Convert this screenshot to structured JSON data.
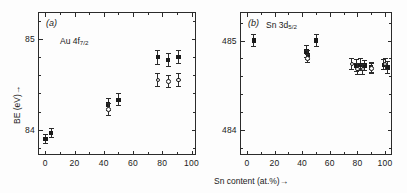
{
  "figure": {
    "xlabel": "Sn content (at.%)→",
    "ylabel": "BE (eV)→"
  },
  "chart_data": [
    {
      "type": "scatter",
      "panel": "(a)",
      "series_label_main": "Au 4f",
      "series_label_sub": "7/2",
      "title": "",
      "xlabel": "Sn content (at.%)→",
      "ylabel": "BE (eV)→",
      "xlim": [
        -5,
        103
      ],
      "ylim": [
        83.72,
        85.3
      ],
      "xticks": [
        0,
        20,
        40,
        60,
        80,
        100
      ],
      "xticklabels": [
        "0",
        "20",
        "40",
        "60",
        "80",
        "100"
      ],
      "yticks": [
        84,
        85
      ],
      "yticklabels": [
        "84",
        "85"
      ],
      "grid": false,
      "legend": "none",
      "series": [
        {
          "name": "filled-square",
          "marker": "filled-square",
          "points": [
            {
              "x": 0,
              "y": 83.9,
              "yerr": 0.055
            },
            {
              "x": 4,
              "y": 83.96,
              "yerr": 0.055
            },
            {
              "x": 43,
              "y": 84.28,
              "yerr": 0.075
            },
            {
              "x": 50,
              "y": 84.33,
              "yerr": 0.07
            },
            {
              "x": 77,
              "y": 84.8,
              "yerr": 0.085
            },
            {
              "x": 84,
              "y": 84.77,
              "yerr": 0.08
            },
            {
              "x": 91,
              "y": 84.8,
              "yerr": 0.08
            }
          ]
        },
        {
          "name": "open-circle",
          "marker": "open-circle",
          "points": [
            {
              "x": 43,
              "y": 84.22,
              "yerr": 0.07
            },
            {
              "x": 77,
              "y": 84.55,
              "yerr": 0.075
            },
            {
              "x": 84,
              "y": 84.53,
              "yerr": 0.075
            },
            {
              "x": 91,
              "y": 84.55,
              "yerr": 0.075
            }
          ]
        }
      ]
    },
    {
      "type": "scatter",
      "panel": "(b)",
      "series_label_main": "Sn 3d",
      "series_label_sub": "5/2",
      "title": "",
      "xlabel": "Sn content (at.%)→",
      "ylabel": "BE (eV)→",
      "xlim": [
        -5,
        105
      ],
      "ylim": [
        483.72,
        485.32
      ],
      "xticks": [
        0,
        20,
        40,
        60,
        80,
        100
      ],
      "xticklabels": [
        "0",
        "20",
        "40",
        "60",
        "80",
        "100"
      ],
      "yticks": [
        484,
        485
      ],
      "yticklabels": [
        "484",
        "485"
      ],
      "grid": false,
      "legend": "none",
      "series": [
        {
          "name": "filled-square",
          "marker": "filled-square",
          "points": [
            {
              "x": 5,
              "y": 485.0,
              "yerr": 0.075
            },
            {
              "x": 43,
              "y": 484.88,
              "yerr": 0.07
            },
            {
              "x": 44,
              "y": 484.84,
              "yerr": 0.06
            },
            {
              "x": 50,
              "y": 485.0,
              "yerr": 0.07
            },
            {
              "x": 79,
              "y": 484.72,
              "yerr": 0.07
            },
            {
              "x": 82,
              "y": 484.73,
              "yerr": 0.07
            },
            {
              "x": 85,
              "y": 484.72,
              "yerr": 0.065
            },
            {
              "x": 90,
              "y": 484.7,
              "yerr": 0.065
            },
            {
              "x": 99,
              "y": 484.73,
              "yerr": 0.06
            },
            {
              "x": 102,
              "y": 484.7,
              "yerr": 0.075
            }
          ]
        },
        {
          "name": "open-circle",
          "marker": "open-circle",
          "points": [
            {
              "x": 44,
              "y": 484.8,
              "yerr": 0.055
            },
            {
              "x": 76,
              "y": 484.74,
              "yerr": 0.065
            },
            {
              "x": 80,
              "y": 484.68,
              "yerr": 0.065
            },
            {
              "x": 84,
              "y": 484.68,
              "yerr": 0.06
            },
            {
              "x": 90,
              "y": 484.69,
              "yerr": 0.06
            },
            {
              "x": 100,
              "y": 484.74,
              "yerr": 0.07
            }
          ]
        }
      ]
    }
  ]
}
